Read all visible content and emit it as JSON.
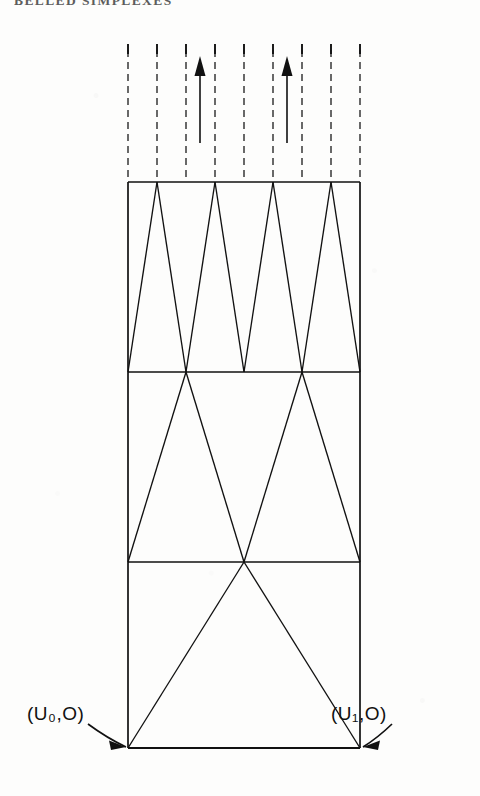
{
  "page": {
    "header_text": "BELLED  SIMPLEXES",
    "background_color": "#fdfdfc",
    "ink_color": "#111111"
  },
  "figure": {
    "name": "triangulated-prism-diagram",
    "frame": {
      "left": 128,
      "right": 360,
      "top": 182,
      "bottom": 748
    },
    "bands": [
      {
        "index": 0,
        "y_top": 182,
        "y_bottom": 372,
        "triangle_count": 4
      },
      {
        "index": 1,
        "y_top": 372,
        "y_bottom": 562,
        "triangle_count": 2
      },
      {
        "index": 2,
        "y_top": 562,
        "y_bottom": 748,
        "triangle_count": 1
      }
    ],
    "dashed_column": {
      "y_top": 50,
      "y_bottom": 182,
      "tick_y_top": 44,
      "tick_y_bottom": 54,
      "x_positions": [
        128,
        157,
        186,
        215,
        244,
        273,
        302,
        331,
        360
      ]
    },
    "arrows_up": [
      {
        "x": 200,
        "y_tail": 143,
        "y_head": 56
      },
      {
        "x": 287,
        "y_tail": 143,
        "y_head": 56
      }
    ],
    "labels": {
      "left_vertex": "(U₀,O)",
      "right_vertex": "(U₁,O)"
    },
    "callouts": [
      {
        "name": "left-callout-arrow",
        "from_x": 88,
        "from_y": 724,
        "to_x": 126,
        "to_y": 747
      },
      {
        "name": "right-callout-arrow",
        "from_x": 392,
        "from_y": 724,
        "to_x": 363,
        "to_y": 747
      }
    ]
  },
  "chart_data": {
    "type": "diagram",
    "title": "BELLED  SIMPLEXES",
    "subdivision_levels": [
      4,
      2,
      1
    ],
    "vertex_labels": [
      "(U₀,O)",
      "(U₁,O)"
    ]
  }
}
